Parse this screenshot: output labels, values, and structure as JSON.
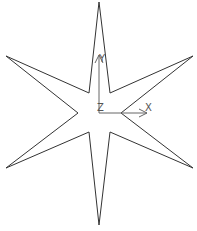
{
  "canvas": {
    "width": 197,
    "height": 231,
    "background": "#ffffff"
  },
  "star": {
    "stroke": "#333333",
    "fill": "#ffffff",
    "points": "99,2 110,93 193,56 121,113 193,168 110,132 99,225 89,132 6,168 78,113 6,56 89,93"
  },
  "axes": {
    "color": "#666666",
    "origin": {
      "x": 99,
      "y": 113
    },
    "x_axis": {
      "label": "X",
      "end": {
        "x": 147,
        "y": 113
      }
    },
    "y_axis": {
      "label": "Y",
      "end": {
        "x": 99,
        "y": 53
      }
    },
    "z_axis": {
      "label": "Z"
    }
  }
}
